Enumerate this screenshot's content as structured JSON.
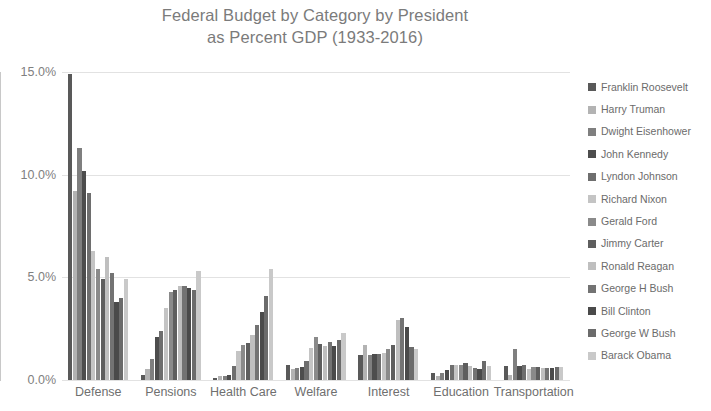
{
  "chart_data": {
    "type": "bar",
    "title": "Federal Budget by Category by President as Percent GDP (1933-2016)",
    "title_lines": [
      "Federal Budget by Category by President",
      "as Percent GDP (1933-2016)"
    ],
    "xlabel": "",
    "ylabel": "",
    "ylim": [
      0,
      15
    ],
    "ytick_labels": [
      "0.0%",
      "5.0%",
      "10.0%",
      "15.0%"
    ],
    "ytick_values": [
      0,
      5,
      10,
      15
    ],
    "grid": true,
    "legend_position": "right",
    "categories": [
      "Defense",
      "Pensions",
      "Health Care",
      "Welfare",
      "Interest",
      "Education",
      "Transportation"
    ],
    "series": [
      {
        "name": "Franklin Roosevelt",
        "color": "#595959",
        "values": [
          14.9,
          0.25,
          0.1,
          0.75,
          1.2,
          0.35,
          0.7
        ]
      },
      {
        "name": "Harry Truman",
        "color": "#b3b3b3",
        "values": [
          9.2,
          0.55,
          0.2,
          0.55,
          1.7,
          0.2,
          0.25
        ]
      },
      {
        "name": "Dwight Eisenhower",
        "color": "#7f7f7f",
        "values": [
          11.3,
          1.0,
          0.2,
          0.6,
          1.2,
          0.35,
          1.5
        ]
      },
      {
        "name": "John Kennedy",
        "color": "#4d4d4d",
        "values": [
          10.2,
          2.1,
          0.25,
          0.65,
          1.25,
          0.5,
          0.7
        ]
      },
      {
        "name": "Lyndon Johnson",
        "color": "#6e6e6e",
        "values": [
          9.1,
          2.4,
          0.7,
          0.95,
          1.25,
          0.75,
          0.75
        ]
      },
      {
        "name": "Richard Nixon",
        "color": "#c4c4c4",
        "values": [
          6.3,
          3.5,
          1.4,
          1.55,
          1.3,
          0.75,
          0.55
        ]
      },
      {
        "name": "Gerald Ford",
        "color": "#8a8a8a",
        "values": [
          5.4,
          4.3,
          1.7,
          2.1,
          1.5,
          0.75,
          0.65
        ]
      },
      {
        "name": "Jimmy Carter",
        "color": "#5e5e5e",
        "values": [
          4.9,
          4.4,
          1.8,
          1.75,
          1.7,
          0.85,
          0.65
        ]
      },
      {
        "name": "Ronald Reagan",
        "color": "#bfbfbf",
        "values": [
          6.0,
          4.6,
          2.2,
          1.65,
          2.9,
          0.7,
          0.6
        ]
      },
      {
        "name": "George H Bush",
        "color": "#737373",
        "values": [
          5.2,
          4.6,
          2.7,
          1.85,
          3.0,
          0.6,
          0.6
        ]
      },
      {
        "name": "Bill Clinton",
        "color": "#4a4a4a",
        "values": [
          3.8,
          4.5,
          3.3,
          1.65,
          2.6,
          0.55,
          0.6
        ]
      },
      {
        "name": "George W Bush",
        "color": "#6b6b6b",
        "values": [
          4.0,
          4.4,
          4.1,
          1.95,
          1.6,
          0.95,
          0.65
        ]
      },
      {
        "name": "Barack Obama",
        "color": "#c9c9c9",
        "values": [
          4.9,
          5.3,
          5.4,
          2.3,
          1.5,
          0.7,
          0.65
        ]
      }
    ]
  }
}
